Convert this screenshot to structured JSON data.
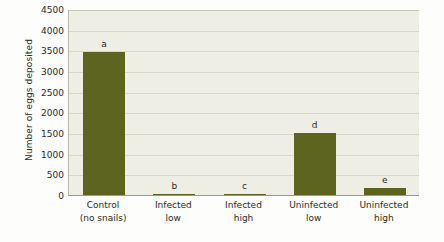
{
  "chart_data": {
    "type": "bar",
    "title": "",
    "xlabel": "",
    "ylabel": "Number of eggs deposited",
    "ylim": [
      0,
      4500
    ],
    "ytick_labels": [
      "4500",
      "4000",
      "3500",
      "3000",
      "2500",
      "2000",
      "1500",
      "1000",
      "500",
      "0"
    ],
    "ytick_values": [
      4500,
      4000,
      3500,
      3000,
      2500,
      2000,
      1500,
      1000,
      500,
      0
    ],
    "grid": "horizontal",
    "legend": "none",
    "bar_color": "#5d6420",
    "plot_background": "#eeeee4",
    "gridline_color": "#d8d8ca",
    "categories": [
      "Control (no snails)",
      "Infected low",
      "Infected high",
      "Uninfected low",
      "Uninfected high"
    ],
    "category_lines": [
      [
        "Control",
        "(no snails)"
      ],
      [
        "Infected",
        "low"
      ],
      [
        "Infected",
        "high"
      ],
      [
        "Uninfected",
        "low"
      ],
      [
        "Uninfected",
        "high"
      ]
    ],
    "values": [
      3450,
      25,
      20,
      1500,
      180
    ],
    "annotations": [
      "a",
      "b",
      "c",
      "d",
      "e"
    ],
    "annotation_note": "letters denote statistically significant groups"
  }
}
